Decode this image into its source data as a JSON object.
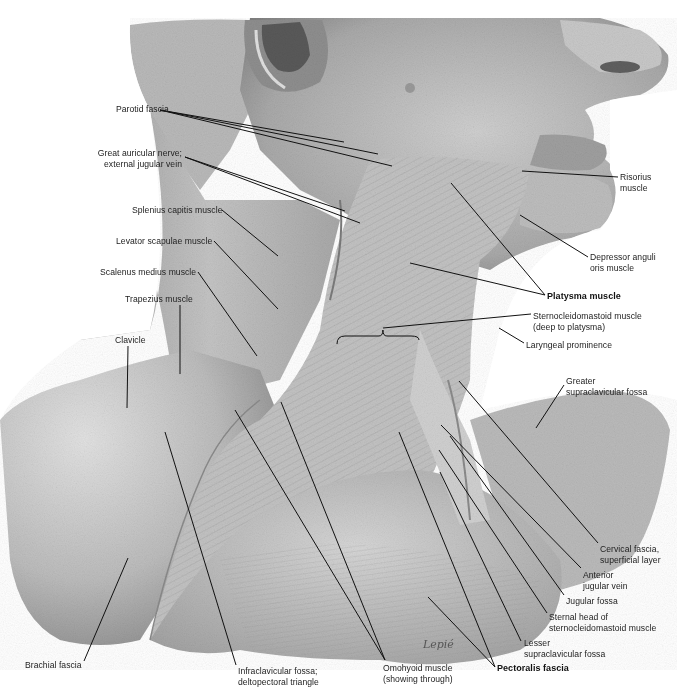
{
  "figure": {
    "colors": {
      "background": "#ffffff",
      "skin_light": "#d9d9d9",
      "skin_mid": "#b5b5b5",
      "skin_dark": "#7a7a7a",
      "leader": "#111111",
      "text": "#222222"
    },
    "signature": "Lepié"
  },
  "labels": [
    {
      "id": "parotid-fascia",
      "text": "Parotid fascia",
      "x": 116,
      "y": 104,
      "bold": false,
      "align": "left"
    },
    {
      "id": "great-auricular-nerve",
      "text": "Great auricular nerve;\nexternal jugular vein",
      "x": 107,
      "y": 148,
      "bold": false,
      "align": "right"
    },
    {
      "id": "splenius-capitis",
      "text": "Splenius capitis muscle",
      "x": 132,
      "y": 205,
      "bold": false,
      "align": "left"
    },
    {
      "id": "levator-scapulae",
      "text": "Levator scapulae muscle",
      "x": 116,
      "y": 236,
      "bold": false,
      "align": "left"
    },
    {
      "id": "scalenus-medius",
      "text": "Scalenus medius muscle",
      "x": 100,
      "y": 267,
      "bold": false,
      "align": "left"
    },
    {
      "id": "trapezius",
      "text": "Trapezius muscle",
      "x": 125,
      "y": 294,
      "bold": false,
      "align": "left"
    },
    {
      "id": "clavicle",
      "text": "Clavicle",
      "x": 115,
      "y": 335,
      "bold": false,
      "align": "left"
    },
    {
      "id": "risorius",
      "text": "Risorius\nmuscle",
      "x": 620,
      "y": 172,
      "bold": false,
      "align": "left"
    },
    {
      "id": "depressor-anguli-oris",
      "text": "Depressor anguli\noris muscle",
      "x": 590,
      "y": 252,
      "bold": false,
      "align": "left"
    },
    {
      "id": "platysma",
      "text": "Platysma muscle",
      "x": 547,
      "y": 291,
      "bold": true,
      "align": "left"
    },
    {
      "id": "sternocleidomastoid-deep",
      "text": "Sternocleidomastoid muscle\n(deep to platysma)",
      "x": 533,
      "y": 311,
      "bold": false,
      "align": "left"
    },
    {
      "id": "laryngeal-prominence",
      "text": "Laryngeal prominence",
      "x": 526,
      "y": 340,
      "bold": false,
      "align": "left"
    },
    {
      "id": "greater-supraclavicular-fossa",
      "text": "Greater\nsupraclavicular fossa",
      "x": 566,
      "y": 376,
      "bold": false,
      "align": "left"
    },
    {
      "id": "cervical-fascia",
      "text": "Cervical fascia,\nsuperficial layer",
      "x": 600,
      "y": 544,
      "bold": false,
      "align": "left"
    },
    {
      "id": "anterior-jugular-vein",
      "text": "Anterior\njugular vein",
      "x": 583,
      "y": 570,
      "bold": false,
      "align": "left"
    },
    {
      "id": "jugular-fossa",
      "text": "Jugular fossa",
      "x": 566,
      "y": 596,
      "bold": false,
      "align": "left"
    },
    {
      "id": "sternal-head",
      "text": "Sternal head of\nsternocleidomastoid muscle",
      "x": 549,
      "y": 612,
      "bold": false,
      "align": "left"
    },
    {
      "id": "lesser-supraclavicular-fossa",
      "text": "Lesser\nsupraclavicular fossa",
      "x": 524,
      "y": 638,
      "bold": false,
      "align": "left"
    },
    {
      "id": "pectoralis-fascia",
      "text": "Pectoralis fascia",
      "x": 497,
      "y": 663,
      "bold": true,
      "align": "left"
    },
    {
      "id": "omohyoid",
      "text": "Omohyoid muscle\n(showing through)",
      "x": 383,
      "y": 663,
      "bold": false,
      "align": "left"
    },
    {
      "id": "infraclavicular-fossa",
      "text": "Infraclavicular fossa;\ndeltopectoral triangle",
      "x": 238,
      "y": 666,
      "bold": false,
      "align": "left"
    },
    {
      "id": "brachial-fascia",
      "text": "Brachial fascia",
      "x": 25,
      "y": 660,
      "bold": false,
      "align": "left"
    }
  ],
  "leaders": [
    {
      "for": "parotid-fascia",
      "x1": 160,
      "y1": 110,
      "x2": 344,
      "y2": 142
    },
    {
      "for": "parotid-fascia",
      "x1": 160,
      "y1": 110,
      "x2": 378,
      "y2": 154
    },
    {
      "for": "parotid-fascia",
      "x1": 160,
      "y1": 110,
      "x2": 392,
      "y2": 166
    },
    {
      "for": "great-auricular-nerve",
      "x1": 185,
      "y1": 157,
      "x2": 345,
      "y2": 211
    },
    {
      "for": "great-auricular-nerve",
      "x1": 185,
      "y1": 157,
      "x2": 360,
      "y2": 223
    },
    {
      "for": "splenius-capitis",
      "x1": 222,
      "y1": 210,
      "x2": 278,
      "y2": 256
    },
    {
      "for": "levator-scapulae",
      "x1": 214,
      "y1": 241,
      "x2": 278,
      "y2": 309
    },
    {
      "for": "scalenus-medius",
      "x1": 198,
      "y1": 272,
      "x2": 257,
      "y2": 356
    },
    {
      "for": "trapezius",
      "x1": 180,
      "y1": 305,
      "x2": 180,
      "y2": 374
    },
    {
      "for": "clavicle",
      "x1": 128,
      "y1": 346,
      "x2": 127,
      "y2": 408
    },
    {
      "for": "risorius",
      "x1": 618,
      "y1": 177,
      "x2": 522,
      "y2": 171
    },
    {
      "for": "depressor-anguli-oris",
      "x1": 588,
      "y1": 257,
      "x2": 520,
      "y2": 215
    },
    {
      "for": "platysma",
      "x1": 545,
      "y1": 295,
      "x2": 451,
      "y2": 183
    },
    {
      "for": "platysma",
      "x1": 545,
      "y1": 295,
      "x2": 410,
      "y2": 263
    },
    {
      "for": "sternocleidomastoid-deep",
      "x1": 531,
      "y1": 314,
      "x2": 383,
      "y2": 328
    },
    {
      "for": "laryngeal-prominence",
      "x1": 524,
      "y1": 343,
      "x2": 499,
      "y2": 328
    },
    {
      "for": "greater-supraclavicular-fossa",
      "x1": 564,
      "y1": 385,
      "x2": 536,
      "y2": 428
    },
    {
      "for": "cervical-fascia",
      "x1": 598,
      "y1": 543,
      "x2": 459,
      "y2": 381
    },
    {
      "for": "anterior-jugular-vein",
      "x1": 581,
      "y1": 568,
      "x2": 441,
      "y2": 425
    },
    {
      "for": "jugular-fossa",
      "x1": 564,
      "y1": 595,
      "x2": 450,
      "y2": 436
    },
    {
      "for": "sternal-head",
      "x1": 547,
      "y1": 613,
      "x2": 439,
      "y2": 450
    },
    {
      "for": "lesser-supraclavicular-fossa",
      "x1": 521,
      "y1": 641,
      "x2": 440,
      "y2": 472
    },
    {
      "for": "pectoralis-fascia",
      "x1": 495,
      "y1": 667,
      "x2": 428,
      "y2": 597
    },
    {
      "for": "pectoralis-fascia",
      "x1": 495,
      "y1": 667,
      "x2": 399,
      "y2": 432
    },
    {
      "for": "omohyoid",
      "x1": 385,
      "y1": 660,
      "x2": 235,
      "y2": 410
    },
    {
      "for": "omohyoid",
      "x1": 385,
      "y1": 660,
      "x2": 281,
      "y2": 402
    },
    {
      "for": "infraclavicular-fossa",
      "x1": 236,
      "y1": 665,
      "x2": 165,
      "y2": 432
    },
    {
      "for": "brachial-fascia",
      "x1": 84,
      "y1": 661,
      "x2": 128,
      "y2": 558
    }
  ],
  "brace": {
    "for": "sternocleidomastoid-deep",
    "x": 337,
    "y": 336,
    "width": 82
  }
}
